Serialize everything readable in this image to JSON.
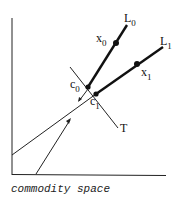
{
  "diagram": {
    "caption": "commodity space",
    "colors": {
      "ink": "#111111",
      "background": "#ffffff"
    },
    "rays": [
      {
        "id": "L0",
        "label": "L",
        "subscript": "0",
        "start_label": "c",
        "start_sub": "0",
        "point_label": "x",
        "point_sub": "0"
      },
      {
        "id": "L1",
        "label": "L",
        "subscript": "1",
        "start_label": "c",
        "start_sub": "1",
        "point_label": "x",
        "point_sub": "1"
      }
    ],
    "tangent": {
      "label": "T"
    }
  }
}
